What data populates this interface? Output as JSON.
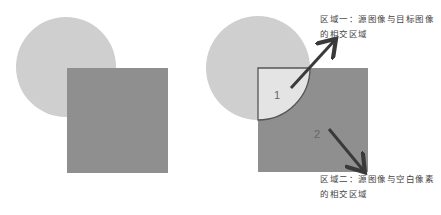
{
  "colors": {
    "background": "#ffffff",
    "circle": "#cfcfcf",
    "square": "#8f8f8f",
    "intersection": "#e4e4e4",
    "outline": "#555555",
    "arrow": "#3a3a3a"
  },
  "left_figure": {
    "shapes": [
      "source-circle",
      "target-square"
    ]
  },
  "right_figure": {
    "region1_label": "1",
    "region2_label": "2"
  },
  "annotations": {
    "region1": {
      "line1": "区域一：源图像与目标图像",
      "line2": "的相交区域"
    },
    "region2": {
      "line1": "区域二：源图像与空白像素",
      "line2": "的相交区域"
    }
  }
}
